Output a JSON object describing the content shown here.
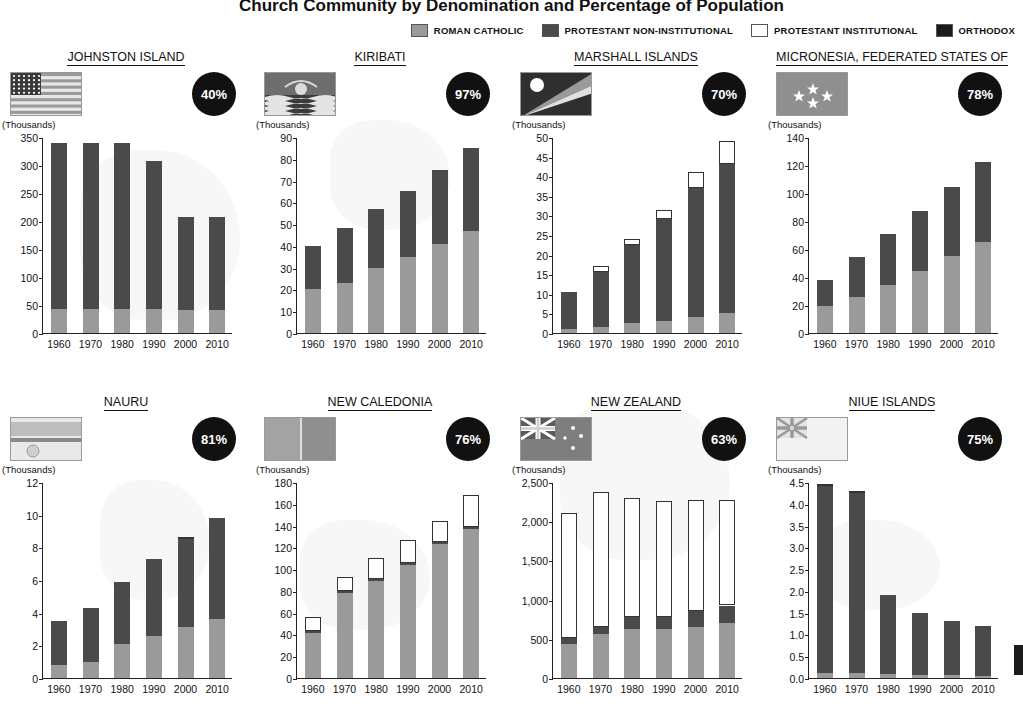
{
  "header": {
    "title": "Church Community by Denomination and Percentage of Population",
    "legend": [
      {
        "label": "ROMAN CATHOLIC",
        "color": "#9a9a9a"
      },
      {
        "label": "PROTESTANT NON-INSTITUTIONAL",
        "color": "#4a4a4a"
      },
      {
        "label": "PROTESTANT INSTITUTIONAL",
        "color": "#ffffff"
      },
      {
        "label": "ORTHODOX",
        "color": "#1b1b1b"
      }
    ],
    "units_label": "(Thousands)"
  },
  "chart_data": [
    {
      "type": "bar",
      "stacked": true,
      "title": "JOHNSTON ISLAND",
      "percent": "40%",
      "flag": "johnston-island-flag",
      "ylabel": "(Thousands)",
      "categories": [
        "1960",
        "1970",
        "1980",
        "1990",
        "2000",
        "2010"
      ],
      "yticks": [
        0,
        50,
        100,
        150,
        200,
        250,
        300,
        350
      ],
      "ylim": [
        0,
        350
      ],
      "series": [
        {
          "name": "ROMAN CATHOLIC",
          "color": "#9a9a9a",
          "values": [
            42,
            42,
            42,
            42,
            41,
            41
          ]
        },
        {
          "name": "PROTESTANT NON-INSTITUTIONAL",
          "color": "#4a4a4a",
          "values": [
            297,
            297,
            297,
            266,
            167,
            167
          ]
        },
        {
          "name": "PROTESTANT INSTITUTIONAL",
          "color": "#ffffff",
          "values": [
            0,
            0,
            0,
            0,
            0,
            0
          ]
        },
        {
          "name": "ORTHODOX",
          "color": "#1b1b1b",
          "values": [
            0,
            0,
            0,
            0,
            0,
            0
          ]
        }
      ]
    },
    {
      "type": "bar",
      "stacked": true,
      "title": "KIRIBATI",
      "percent": "97%",
      "flag": "kiribati-flag",
      "ylabel": "(Thousands)",
      "categories": [
        "1960",
        "1970",
        "1980",
        "1990",
        "2000",
        "2010"
      ],
      "yticks": [
        0,
        10,
        20,
        30,
        40,
        50,
        60,
        70,
        80,
        90
      ],
      "ylim": [
        0,
        90
      ],
      "series": [
        {
          "name": "ROMAN CATHOLIC",
          "color": "#9a9a9a",
          "values": [
            20,
            23,
            30,
            35,
            41,
            47
          ]
        },
        {
          "name": "PROTESTANT NON-INSTITUTIONAL",
          "color": "#4a4a4a",
          "values": [
            20,
            25,
            27,
            30,
            34,
            38
          ]
        },
        {
          "name": "PROTESTANT INSTITUTIONAL",
          "color": "#ffffff",
          "values": [
            0,
            0,
            0,
            0,
            0,
            0
          ]
        },
        {
          "name": "ORTHODOX",
          "color": "#1b1b1b",
          "values": [
            0,
            0,
            0,
            0,
            0,
            0
          ]
        }
      ]
    },
    {
      "type": "bar",
      "stacked": true,
      "title": "MARSHALL ISLANDS",
      "percent": "70%",
      "flag": "marshall-islands-flag",
      "ylabel": "(Thousands)",
      "categories": [
        "1960",
        "1970",
        "1980",
        "1990",
        "2000",
        "2010"
      ],
      "yticks": [
        0,
        5,
        10,
        15,
        20,
        25,
        30,
        35,
        40,
        45,
        50
      ],
      "ylim": [
        0,
        50
      ],
      "series": [
        {
          "name": "ROMAN CATHOLIC",
          "color": "#9a9a9a",
          "values": [
            1,
            1.5,
            2.5,
            3,
            4,
            5
          ]
        },
        {
          "name": "PROTESTANT NON-INSTITUTIONAL",
          "color": "#4a4a4a",
          "values": [
            9.5,
            14,
            20,
            26,
            33,
            38
          ]
        },
        {
          "name": "PROTESTANT INSTITUTIONAL",
          "color": "#ffffff",
          "values": [
            0,
            1.5,
            1.5,
            2.5,
            4,
            6
          ]
        },
        {
          "name": "ORTHODOX",
          "color": "#1b1b1b",
          "values": [
            0,
            0,
            0,
            0,
            0,
            0
          ]
        }
      ]
    },
    {
      "type": "bar",
      "stacked": true,
      "title": "MICRONESIA, FEDERATED STATES OF",
      "percent": "78%",
      "flag": "micronesia-flag",
      "ylabel": "(Thousands)",
      "categories": [
        "1960",
        "1970",
        "1980",
        "1990",
        "2000",
        "2010"
      ],
      "yticks": [
        0,
        20,
        40,
        60,
        80,
        100,
        120,
        140
      ],
      "ylim": [
        0,
        140
      ],
      "series": [
        {
          "name": "ROMAN CATHOLIC",
          "color": "#9a9a9a",
          "values": [
            19,
            26,
            34,
            44,
            55,
            65
          ]
        },
        {
          "name": "PROTESTANT NON-INSTITUTIONAL",
          "color": "#4a4a4a",
          "values": [
            19,
            28,
            37,
            43,
            49,
            57
          ]
        },
        {
          "name": "PROTESTANT INSTITUTIONAL",
          "color": "#ffffff",
          "values": [
            0,
            0,
            0,
            0,
            0,
            0
          ]
        },
        {
          "name": "ORTHODOX",
          "color": "#1b1b1b",
          "values": [
            0,
            0,
            0,
            0,
            0,
            0
          ]
        }
      ]
    },
    {
      "type": "bar",
      "stacked": true,
      "title": "NAURU",
      "percent": "81%",
      "flag": "nauru-flag",
      "ylabel": "(Thousands)",
      "categories": [
        "1960",
        "1970",
        "1980",
        "1990",
        "2000",
        "2010"
      ],
      "yticks": [
        0,
        2,
        4,
        6,
        8,
        10,
        12
      ],
      "ylim": [
        0,
        12
      ],
      "series": [
        {
          "name": "ROMAN CATHOLIC",
          "color": "#9a9a9a",
          "values": [
            0.8,
            1.0,
            2.1,
            2.6,
            3.1,
            3.6
          ]
        },
        {
          "name": "PROTESTANT NON-INSTITUTIONAL",
          "color": "#4a4a4a",
          "values": [
            2.7,
            3.3,
            3.8,
            4.7,
            5.4,
            6.2
          ]
        },
        {
          "name": "PROTESTANT INSTITUTIONAL",
          "color": "#ffffff",
          "values": [
            0,
            0,
            0,
            0,
            0.1,
            0
          ]
        },
        {
          "name": "ORTHODOX",
          "color": "#1b1b1b",
          "values": [
            0,
            0,
            0,
            0,
            0,
            0
          ]
        }
      ]
    },
    {
      "type": "bar",
      "stacked": true,
      "title": "NEW CALEDONIA",
      "percent": "76%",
      "flag": "new-caledonia-flag",
      "ylabel": "(Thousands)",
      "categories": [
        "1960",
        "1970",
        "1980",
        "1990",
        "2000",
        "2010"
      ],
      "yticks": [
        0,
        20,
        40,
        60,
        80,
        100,
        120,
        140,
        160,
        180
      ],
      "ylim": [
        0,
        180
      ],
      "series": [
        {
          "name": "ROMAN CATHOLIC",
          "color": "#9a9a9a",
          "values": [
            41,
            78,
            89,
            104,
            123,
            137
          ]
        },
        {
          "name": "PROTESTANT NON-INSTITUTIONAL",
          "color": "#4a4a4a",
          "values": [
            2,
            2,
            2,
            2,
            2,
            2
          ]
        },
        {
          "name": "PROTESTANT INSTITUTIONAL",
          "color": "#ffffff",
          "values": [
            13,
            13,
            19,
            21,
            19,
            29
          ]
        },
        {
          "name": "ORTHODOX",
          "color": "#1b1b1b",
          "values": [
            0,
            0,
            0,
            0,
            0,
            0
          ]
        }
      ]
    },
    {
      "type": "bar",
      "stacked": true,
      "title": "NEW ZEALAND",
      "percent": "63%",
      "flag": "new-zealand-flag",
      "ylabel": "(Thousands)",
      "categories": [
        "1960",
        "1970",
        "1980",
        "1990",
        "2000",
        "2010"
      ],
      "yticks": [
        0,
        500,
        1000,
        1500,
        2000,
        2500
      ],
      "ytick_labels": [
        "0",
        "500",
        "1,000",
        "1,500",
        "2,000",
        "2,500"
      ],
      "ylim": [
        0,
        2500
      ],
      "series": [
        {
          "name": "ROMAN CATHOLIC",
          "color": "#9a9a9a",
          "values": [
            440,
            560,
            620,
            625,
            650,
            700
          ]
        },
        {
          "name": "PROTESTANT NON-INSTITUTIONAL",
          "color": "#4a4a4a",
          "values": [
            65,
            90,
            155,
            150,
            205,
            225
          ]
        },
        {
          "name": "PROTESTANT INSTITUTIONAL",
          "color": "#ffffff",
          "values": [
            1600,
            1725,
            1520,
            1480,
            1415,
            1350
          ]
        },
        {
          "name": "ORTHODOX",
          "color": "#1b1b1b",
          "values": [
            0,
            0,
            0,
            0,
            0,
            0
          ]
        }
      ]
    },
    {
      "type": "bar",
      "stacked": true,
      "title": "NIUE ISLANDS",
      "percent": "75%",
      "flag": "niue-islands-flag",
      "ylabel": "(Thousands)",
      "categories": [
        "1960",
        "1970",
        "1980",
        "1990",
        "2000",
        "2010"
      ],
      "yticks": [
        0.0,
        0.5,
        1.0,
        1.5,
        2.0,
        2.5,
        3.0,
        3.5,
        4.0,
        4.5
      ],
      "ytick_labels": [
        "0.0",
        "0.5",
        "1.0",
        "1.5",
        "2.0",
        "2.5",
        "3.0",
        "3.5",
        "4.0",
        "4.5"
      ],
      "ylim": [
        0,
        4.5
      ],
      "series": [
        {
          "name": "ROMAN CATHOLIC",
          "color": "#9a9a9a",
          "values": [
            0.12,
            0.12,
            0.1,
            0.08,
            0.06,
            0.05
          ]
        },
        {
          "name": "PROTESTANT NON-INSTITUTIONAL",
          "color": "#4a4a4a",
          "values": [
            4.28,
            4.13,
            1.8,
            1.42,
            1.24,
            1.15
          ]
        },
        {
          "name": "PROTESTANT INSTITUTIONAL",
          "color": "#ffffff",
          "values": [
            0.05,
            0.05,
            0,
            0,
            0,
            0
          ]
        },
        {
          "name": "ORTHODOX",
          "color": "#1b1b1b",
          "values": [
            0,
            0,
            0,
            0,
            0,
            0
          ]
        }
      ]
    }
  ]
}
